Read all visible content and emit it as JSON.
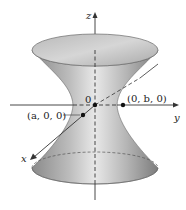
{
  "figure": {
    "axes": {
      "z_label": "z",
      "y_label": "y",
      "x_label": "x",
      "origin_label": "0"
    },
    "points": [
      {
        "label": "(a, 0, 0)",
        "name": "point-a"
      },
      {
        "label": "(0, b, 0)",
        "name": "point-b"
      }
    ],
    "colors": {
      "surface_dark": "#7a7a7a",
      "surface_light": "#e6e6e6",
      "axis": "#333333",
      "background": "#ffffff"
    }
  }
}
